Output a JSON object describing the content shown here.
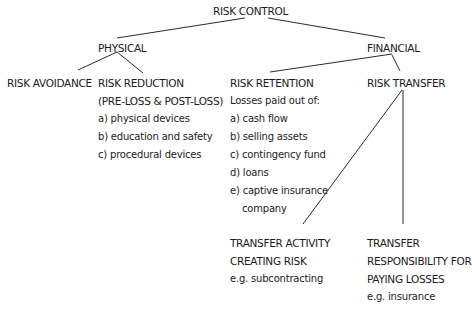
{
  "diagram": {
    "root": {
      "label": "RISK CONTROL"
    },
    "branches": [
      {
        "label": "PHYSICAL",
        "children": [
          {
            "label": "RISK AVOIDANCE",
            "lines": []
          },
          {
            "label": "RISK REDUCTION",
            "lines": [
              "(PRE-LOSS & POST-LOSS)",
              "a) physical devices",
              "b) education and safety",
              "c) procedural devices"
            ]
          }
        ]
      },
      {
        "label": "FINANCIAL",
        "children": [
          {
            "label": "RISK RETENTION",
            "lines": [
              "Losses paid out of:",
              "a) cash flow",
              "b) selling assets",
              "c) contingency fund",
              "d) loans",
              "e) captive insurance",
              "company"
            ]
          },
          {
            "label": "RISK TRANSFER",
            "children": [
              {
                "label_lines": [
                  "TRANSFER ACTIVITY",
                  "CREATING RISK"
                ],
                "example": "e.g. subcontracting"
              },
              {
                "label_lines": [
                  "TRANSFER",
                  "RESPONSIBILITY FOR",
                  "PAYING LOSSES"
                ],
                "example": "e.g. insurance"
              }
            ]
          }
        ]
      }
    ],
    "line_color": "#2a2a2a"
  }
}
